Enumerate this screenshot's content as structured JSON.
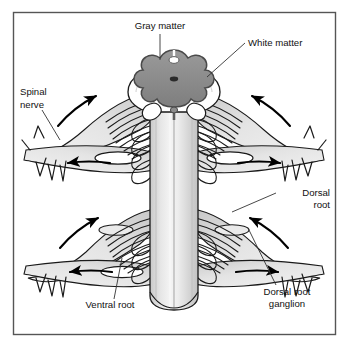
{
  "figure": {
    "frame_color": "#555555",
    "background_color": "#ffffff"
  },
  "palette": {
    "outline": "#1a1a1a",
    "gray_matter_fill": "#8d8d8d",
    "gray_matter_edge": "#5e5e5e",
    "white_matter_fill": "#ffffff",
    "cord_light": "#e3e3e3",
    "cord_mid": "#cfcfcf",
    "cord_highlight": "#f3f3f3",
    "nerve_fill": "#dcdcdc",
    "nerve_shadow": "#b4b4b4",
    "arrow_color": "#000000",
    "leader_color": "#333333",
    "text_color": "#111111"
  },
  "labels": [
    {
      "id": "gray-matter",
      "name": "label-gray-matter",
      "lines": [
        "Gray matter"
      ],
      "x": 160,
      "y": 29,
      "anchor": "middle",
      "leader": [
        [
          160,
          34
        ],
        [
          160,
          60
        ]
      ]
    },
    {
      "id": "white-matter",
      "name": "label-white-matter",
      "lines": [
        "White matter"
      ],
      "x": 248,
      "y": 46,
      "anchor": "start",
      "leader": [
        [
          245,
          43
        ],
        [
          207,
          77
        ]
      ]
    },
    {
      "id": "spinal-nerve",
      "name": "label-spinal-nerve",
      "lines": [
        "Spinal",
        "nerve"
      ],
      "x": 20,
      "y": 95,
      "anchor": "start",
      "leader": [
        [
          42,
          110
        ],
        [
          60,
          140
        ]
      ]
    },
    {
      "id": "dorsal-root",
      "name": "label-dorsal-root",
      "lines": [
        "Dorsal",
        "root"
      ],
      "x": 330,
      "y": 196,
      "anchor": "end",
      "leader": [
        [
          276,
          193
        ],
        [
          232,
          212
        ]
      ]
    },
    {
      "id": "dorsal-root-ganglion",
      "name": "label-dorsal-root-ganglion",
      "lines": [
        "Dorsal root",
        "ganglion"
      ],
      "x": 287,
      "y": 295,
      "anchor": "middle",
      "leader": [
        [
          276,
          285
        ],
        [
          248,
          228
        ]
      ]
    },
    {
      "id": "ventral-root",
      "name": "label-ventral-root",
      "lines": [
        "Ventral root"
      ],
      "x": 110,
      "y": 308,
      "anchor": "middle",
      "leader": [
        [
          114,
          299
        ],
        [
          122,
          258
        ]
      ]
    }
  ],
  "flow_arrows": [
    {
      "id": "upper-left-in",
      "name": "arrow-upper-left-afferent",
      "direction": "up-right"
    },
    {
      "id": "upper-right-in",
      "name": "arrow-upper-right-afferent",
      "direction": "up-left"
    },
    {
      "id": "mid-left-out",
      "name": "arrow-mid-left-efferent",
      "direction": "left"
    },
    {
      "id": "mid-right-out",
      "name": "arrow-mid-right-efferent",
      "direction": "right"
    },
    {
      "id": "lower-left-in",
      "name": "arrow-lower-left-afferent",
      "direction": "up-right"
    },
    {
      "id": "lower-right-in",
      "name": "arrow-lower-right-afferent",
      "direction": "up-left"
    },
    {
      "id": "bottom-left-out",
      "name": "arrow-bottom-left-efferent",
      "direction": "left"
    },
    {
      "id": "bottom-right-out",
      "name": "arrow-bottom-right-efferent",
      "direction": "right"
    }
  ],
  "structures": [
    {
      "id": "gray-matter-butterfly",
      "name": "gray-matter-region"
    },
    {
      "id": "white-matter-region",
      "name": "white-matter-region"
    },
    {
      "id": "spinal-cord-column",
      "name": "spinal-cord-column"
    },
    {
      "id": "dorsal-rootlets",
      "name": "dorsal-rootlet-bundle"
    },
    {
      "id": "ventral-rootlets",
      "name": "ventral-rootlet-bundle"
    },
    {
      "id": "ganglion-swelling",
      "name": "dorsal-root-ganglion-body"
    },
    {
      "id": "spinal-nerve-trunk",
      "name": "spinal-nerve-trunk"
    }
  ]
}
